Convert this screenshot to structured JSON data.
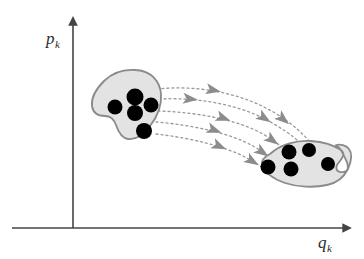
{
  "figure": {
    "background_color": "#ffffff"
  },
  "axes": {
    "line_color": "#444444",
    "y_axis": {
      "label_base": "p",
      "label_sub": "k",
      "name": "momentum-axis",
      "origin": {
        "x": 73,
        "y": 228
      },
      "tip": {
        "x": 73,
        "y": 18
      },
      "label_pos": {
        "x": 46,
        "y": 44
      }
    },
    "x_axis": {
      "label_base": "q",
      "label_sub": "k",
      "name": "position-axis",
      "origin": {
        "x": 12,
        "y": 228
      },
      "tip": {
        "x": 350,
        "y": 228
      },
      "label_pos": {
        "x": 318,
        "y": 248
      }
    }
  },
  "regions": [
    {
      "name": "initial-phase-volume",
      "id": "blob-initial",
      "fill": "#e3e3e3",
      "stroke": "#8a8a8a",
      "stroke_width": 1.8,
      "path": "M 136 70 C 152 71 160 82 161 94 C 162 106 157 117 150 126 C 144 134 136 140 128 139 C 121 138 118 131 116 125 C 114 119 111 116 105 116 C 98 116 93 113 92 106 C 91 98 96 89 104 81 C 113 72 125 69 136 70 Z",
      "points": [
        {
          "name": "particle-dot",
          "cx": 135,
          "cy": 97,
          "r": 8.5
        },
        {
          "name": "particle-dot",
          "cx": 115,
          "cy": 107,
          "r": 7.5
        },
        {
          "name": "particle-dot",
          "cx": 151,
          "cy": 105,
          "r": 7.5
        },
        {
          "name": "particle-dot",
          "cx": 135,
          "cy": 113,
          "r": 8.0
        },
        {
          "name": "particle-dot",
          "cx": 144,
          "cy": 131,
          "r": 8.0
        }
      ]
    },
    {
      "name": "evolved-phase-volume",
      "id": "blob-evolved",
      "fill": "#e3e3e3",
      "stroke": "#8a8a8a",
      "stroke_width": 1.8,
      "path": "M 270 154 C 281 144 297 140 311 141 C 325 142 335 146 341 150 C 347 155 340 160 337 165 C 335 170 338 173 344 172 C 350 171 348 163 345 158 C 343 153 340 148 336 145 C 340 144 346 145 349 149 C 353 154 351 162 348 169 C 344 177 337 183 327 185 C 314 188 297 187 285 183 C 273 179 264 172 262 165 C 261 160 264 157 270 154 Z",
      "points": [
        {
          "name": "particle-dot",
          "cx": 289,
          "cy": 152,
          "r": 7.5
        },
        {
          "name": "particle-dot",
          "cx": 309,
          "cy": 150,
          "r": 7.0
        },
        {
          "name": "particle-dot",
          "cx": 268,
          "cy": 167,
          "r": 7.5
        },
        {
          "name": "particle-dot",
          "cx": 291,
          "cy": 169,
          "r": 7.5
        },
        {
          "name": "particle-dot",
          "cx": 328,
          "cy": 164,
          "r": 7.0
        }
      ]
    }
  ],
  "flow": {
    "name": "hamiltonian-flow-streamlines",
    "stroke": "#9a9a9a",
    "arrow_fill": "#8c8c8c",
    "dash": "2,3",
    "stroke_width": 1.3,
    "streamlines": [
      {
        "name": "flow-streamline",
        "path": "M 157 89 C 196 85 240 92 275 113 C 293 124 303 134 310 142",
        "arrows": [
          {
            "x": 213,
            "y": 90,
            "angle": 12
          },
          {
            "x": 283,
            "y": 119,
            "angle": 40
          }
        ]
      },
      {
        "name": "flow-streamline",
        "path": "M 159 99 C 199 97 243 105 274 124 C 291 134 300 142 306 149",
        "arrows": [
          {
            "x": 190,
            "y": 99,
            "angle": 6
          },
          {
            "x": 264,
            "y": 118,
            "angle": 33
          }
        ]
      },
      {
        "name": "flow-streamline",
        "path": "M 158 111 C 197 112 238 120 263 134 C 278 143 286 150 291 156",
        "arrows": [
          {
            "x": 223,
            "y": 118,
            "angle": 20
          },
          {
            "x": 272,
            "y": 140,
            "angle": 36
          }
        ]
      },
      {
        "name": "flow-streamline",
        "path": "M 156 122 C 194 125 232 134 253 146 C 265 153 272 159 277 164",
        "arrows": [
          {
            "x": 214,
            "y": 130,
            "angle": 20
          },
          {
            "x": 262,
            "y": 152,
            "angle": 35
          }
        ]
      },
      {
        "name": "flow-streamline",
        "path": "M 156 134 C 192 138 226 147 245 157 C 256 163 262 167 267 171",
        "arrows": [
          {
            "x": 219,
            "y": 146,
            "angle": 24
          },
          {
            "x": 252,
            "y": 161,
            "angle": 32
          }
        ]
      }
    ]
  }
}
